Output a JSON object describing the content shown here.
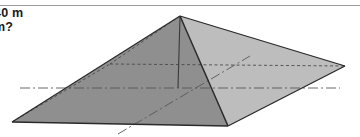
{
  "figure": {
    "title_text_lines": [
      "40 m",
      "m?"
    ],
    "shape_name": "square-pyramid",
    "colors": {
      "background": "#ffffff",
      "face_light": "#c3c3c3",
      "face_mid": "#b4b4b4",
      "base_dark": "#8a8a8a",
      "outline": "#2b2b2b",
      "hidden_edge": "#4a4a4a",
      "rule": "#9a9a9a",
      "text": "#1a1a1a"
    },
    "separator_rule": {
      "name": "top-horizontal-rule",
      "y": 5
    },
    "vertices": {
      "apex": [
        180,
        16
      ],
      "base_left": [
        12,
        122
      ],
      "base_back": [
        110,
        64
      ],
      "base_right": [
        345,
        66
      ],
      "base_front": [
        228,
        126
      ],
      "base_center": [
        178,
        88
      ]
    },
    "edges": [
      {
        "name": "apex-to-base-left",
        "style": "solid"
      },
      {
        "name": "apex-to-base-right",
        "style": "solid"
      },
      {
        "name": "apex-to-base-front",
        "style": "solid"
      },
      {
        "name": "apex-to-base-back",
        "style": "dashed"
      },
      {
        "name": "base-left-to-base-front",
        "style": "solid"
      },
      {
        "name": "base-front-to-base-right",
        "style": "solid"
      },
      {
        "name": "base-left-to-base-back",
        "style": "dashed"
      },
      {
        "name": "base-back-to-base-right",
        "style": "dashed"
      },
      {
        "name": "apex-to-base-center-height",
        "style": "solid"
      },
      {
        "name": "base-diagonal-horizontal",
        "style": "dash-dot"
      },
      {
        "name": "base-diagonal-oblique",
        "style": "dash-dot"
      }
    ]
  }
}
